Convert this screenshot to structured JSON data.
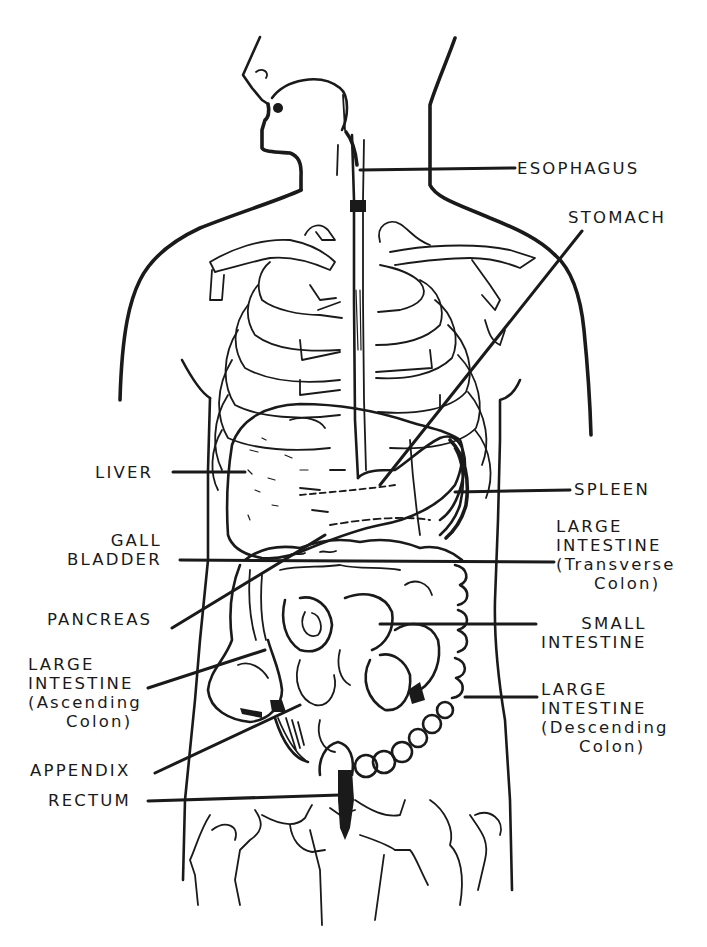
{
  "diagram": {
    "colors": {
      "ink": "#1a1a1a",
      "background": "#ffffff"
    },
    "labels": {
      "esophagus": {
        "lines": [
          "ESOPHAGUS"
        ],
        "x": 517,
        "y": 159,
        "align": "left"
      },
      "stomach": {
        "lines": [
          "STOMACH"
        ],
        "x": 568,
        "y": 208,
        "align": "left"
      },
      "spleen": {
        "lines": [
          "SPLEEN"
        ],
        "x": 574,
        "y": 480,
        "align": "left"
      },
      "large_intestine_transverse": {
        "lines": [
          "LARGE",
          "INTESTINE",
          "(Transverse",
          "Colon)"
        ],
        "x": 556,
        "y": 517,
        "align": "left"
      },
      "small_intestine": {
        "lines": [
          "SMALL",
          "INTESTINE"
        ],
        "x": 541,
        "y": 614,
        "align": "right"
      },
      "large_intestine_descending": {
        "lines": [
          "LARGE",
          "INTESTINE",
          "(Descending",
          "Colon)"
        ],
        "x": 541,
        "y": 680,
        "align": "left"
      },
      "liver": {
        "lines": [
          "LIVER"
        ],
        "x": 95,
        "y": 463,
        "align": "right"
      },
      "gall_bladder": {
        "lines": [
          "GALL",
          "BLADDER"
        ],
        "x": 67,
        "y": 531,
        "align": "right"
      },
      "pancreas": {
        "lines": [
          "PANCREAS"
        ],
        "x": 47,
        "y": 610,
        "align": "left"
      },
      "large_intestine_ascending": {
        "lines": [
          "LARGE",
          "INTESTINE",
          "(Ascending",
          "Colon)"
        ],
        "x": 28,
        "y": 655,
        "align": "left"
      },
      "appendix": {
        "lines": [
          "APPENDIX"
        ],
        "x": 30,
        "y": 761,
        "align": "left"
      },
      "rectum": {
        "lines": [
          "RECTUM"
        ],
        "x": 48,
        "y": 791,
        "align": "left"
      }
    },
    "leaders": [
      {
        "name": "esophagus-leader",
        "points": [
          [
            360,
            170
          ],
          [
            515,
            168
          ]
        ]
      },
      {
        "name": "stomach-leader",
        "points": [
          [
            582,
            231
          ],
          [
            380,
            485
          ]
        ]
      },
      {
        "name": "spleen-leader",
        "points": [
          [
            455,
            492
          ],
          [
            570,
            490
          ]
        ]
      },
      {
        "name": "transverse-colon-leader",
        "points": [
          [
            180,
            560
          ],
          [
            554,
            562
          ]
        ]
      },
      {
        "name": "small-intestine-leader",
        "points": [
          [
            380,
            624
          ],
          [
            536,
            624
          ]
        ]
      },
      {
        "name": "descending-colon-leader",
        "points": [
          [
            465,
            697
          ],
          [
            537,
            697
          ]
        ]
      },
      {
        "name": "liver-leader",
        "points": [
          [
            173,
            472
          ],
          [
            245,
            472
          ]
        ]
      },
      {
        "name": "pancreas-leader",
        "points": [
          [
            172,
            628
          ],
          [
            325,
            535
          ]
        ]
      },
      {
        "name": "ascending-colon-leader",
        "points": [
          [
            148,
            688
          ],
          [
            265,
            650
          ]
        ]
      },
      {
        "name": "appendix-leader",
        "points": [
          [
            155,
            773
          ],
          [
            300,
            705
          ]
        ]
      },
      {
        "name": "rectum-leader",
        "points": [
          [
            148,
            801
          ],
          [
            340,
            795
          ]
        ]
      }
    ]
  }
}
